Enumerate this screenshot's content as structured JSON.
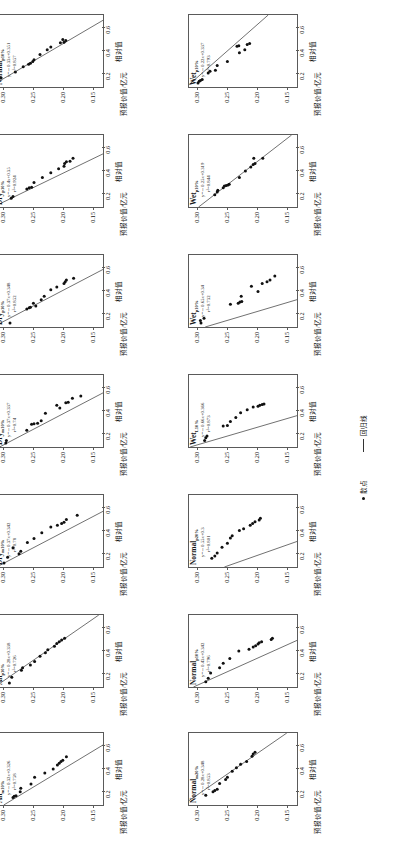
{
  "figure": {
    "axis": {
      "y_label": "预报价值/亿元",
      "x_label": "相对值",
      "y_ticks": [
        "0.30",
        "0.25",
        "0.20",
        "0.15"
      ],
      "x_ticks": [
        "0.2",
        "0.4",
        "0.6"
      ],
      "y_range": [
        0.135,
        0.315
      ],
      "x_range": [
        0.08,
        0.7
      ]
    },
    "legend": {
      "scatter_label": "散点",
      "line_label": "回归线",
      "scatter_marker": "filled-circle-marker",
      "line_marker": "solid-line-marker"
    },
    "colors": {
      "point": "#111111",
      "line": "#333333",
      "frame": "#5a5a5a",
      "text": "#111111"
    }
  },
  "chart_data": [
    {
      "id": "p1",
      "row": 0,
      "col": 0,
      "type": "scatter",
      "title": "Normal",
      "title_sub": "p10%",
      "equation": "y=－0.33x+0.351",
      "r2_text": "r²=0.857",
      "slope": -0.33,
      "intercept": 0.351,
      "r2": 0.857,
      "xlabel": "相对值",
      "ylabel": "预报价值/亿元",
      "xlim": [
        0.08,
        0.7
      ],
      "ylim": [
        0.135,
        0.315
      ],
      "points": [
        {
          "x": 0.12,
          "y": 0.312
        },
        {
          "x": 0.16,
          "y": 0.305
        },
        {
          "x": 0.21,
          "y": 0.281
        },
        {
          "x": 0.255,
          "y": 0.268
        },
        {
          "x": 0.275,
          "y": 0.259
        },
        {
          "x": 0.285,
          "y": 0.256
        },
        {
          "x": 0.3,
          "y": 0.252
        },
        {
          "x": 0.315,
          "y": 0.25
        },
        {
          "x": 0.36,
          "y": 0.24
        },
        {
          "x": 0.4,
          "y": 0.228
        },
        {
          "x": 0.425,
          "y": 0.222
        },
        {
          "x": 0.46,
          "y": 0.206
        },
        {
          "x": 0.465,
          "y": 0.2
        },
        {
          "x": 0.48,
          "y": 0.197
        },
        {
          "x": 0.49,
          "y": 0.202
        }
      ]
    },
    {
      "id": "p2",
      "row": 0,
      "col": 1,
      "type": "scatter",
      "title": "Wet",
      "title_sub": "p10%",
      "equation": "y=－0.22x+0.337",
      "r2_text": "r²=0.793",
      "slope": -0.22,
      "intercept": 0.337,
      "r2": 0.793,
      "xlabel": "相对值",
      "ylabel": "预报价值/亿元",
      "xlim": [
        0.08,
        0.7
      ],
      "ylim": [
        0.135,
        0.315
      ],
      "points": [
        {
          "x": 0.115,
          "y": 0.3
        },
        {
          "x": 0.13,
          "y": 0.298
        },
        {
          "x": 0.135,
          "y": 0.296
        },
        {
          "x": 0.145,
          "y": 0.293
        },
        {
          "x": 0.2,
          "y": 0.283
        },
        {
          "x": 0.215,
          "y": 0.28
        },
        {
          "x": 0.225,
          "y": 0.271
        },
        {
          "x": 0.265,
          "y": 0.268
        },
        {
          "x": 0.3,
          "y": 0.251
        },
        {
          "x": 0.375,
          "y": 0.231
        },
        {
          "x": 0.4,
          "y": 0.222
        },
        {
          "x": 0.43,
          "y": 0.235
        },
        {
          "x": 0.435,
          "y": 0.232
        },
        {
          "x": 0.445,
          "y": 0.218
        },
        {
          "x": 0.455,
          "y": 0.214
        }
      ]
    },
    {
      "id": "p3",
      "row": 1,
      "col": 0,
      "type": "scatter",
      "title": "Dry",
      "title_sub": "p10%",
      "equation": "y=－0.4x+0.35",
      "r2_text": "r²=0.924",
      "slope": -0.4,
      "intercept": 0.35,
      "r2": 0.924,
      "xlabel": "相对值",
      "ylabel": "预报价值/亿元",
      "xlim": [
        0.08,
        0.7
      ],
      "ylim": [
        0.135,
        0.315
      ],
      "points": [
        {
          "x": 0.155,
          "y": 0.288
        },
        {
          "x": 0.17,
          "y": 0.285
        },
        {
          "x": 0.235,
          "y": 0.262
        },
        {
          "x": 0.245,
          "y": 0.258
        },
        {
          "x": 0.25,
          "y": 0.254
        },
        {
          "x": 0.29,
          "y": 0.25
        },
        {
          "x": 0.335,
          "y": 0.236
        },
        {
          "x": 0.375,
          "y": 0.222
        },
        {
          "x": 0.41,
          "y": 0.209
        },
        {
          "x": 0.43,
          "y": 0.2
        },
        {
          "x": 0.455,
          "y": 0.199
        },
        {
          "x": 0.47,
          "y": 0.196
        },
        {
          "x": 0.475,
          "y": 0.19
        },
        {
          "x": 0.5,
          "y": 0.185
        }
      ]
    },
    {
      "id": "p4",
      "row": 1,
      "col": 1,
      "type": "scatter",
      "title": "Wet",
      "title_sub": "p10%",
      "equation": "y=－0.25x+0.319",
      "r2_text": "r²=0.844",
      "slope": -0.25,
      "intercept": 0.319,
      "r2": 0.844,
      "xlabel": "相对值",
      "ylabel": "预报价值/亿元",
      "xlim": [
        0.08,
        0.7
      ],
      "ylim": [
        0.135,
        0.315
      ],
      "points": [
        {
          "x": 0.185,
          "y": 0.272
        },
        {
          "x": 0.21,
          "y": 0.268
        },
        {
          "x": 0.225,
          "y": 0.267
        },
        {
          "x": 0.245,
          "y": 0.258
        },
        {
          "x": 0.26,
          "y": 0.256
        },
        {
          "x": 0.265,
          "y": 0.253
        },
        {
          "x": 0.27,
          "y": 0.25
        },
        {
          "x": 0.275,
          "y": 0.248
        },
        {
          "x": 0.335,
          "y": 0.231
        },
        {
          "x": 0.39,
          "y": 0.221
        },
        {
          "x": 0.425,
          "y": 0.212
        },
        {
          "x": 0.445,
          "y": 0.208
        },
        {
          "x": 0.455,
          "y": 0.205
        },
        {
          "x": 0.5,
          "y": 0.207
        },
        {
          "x": 0.5,
          "y": 0.192
        }
      ]
    },
    {
      "id": "p5",
      "row": 2,
      "col": 0,
      "type": "scatter",
      "title": "Dry",
      "title_sub": "p10%",
      "equation": "y=－0.37x+0.348",
      "r2_text": "r²=0.852",
      "slope": -0.37,
      "intercept": 0.348,
      "r2": 0.852,
      "xlabel": "相对值",
      "ylabel": "预报价值/亿元",
      "xlim": [
        0.08,
        0.7
      ],
      "ylim": [
        0.135,
        0.315
      ],
      "points": [
        {
          "x": 0.115,
          "y": 0.29
        },
        {
          "x": 0.235,
          "y": 0.262
        },
        {
          "x": 0.245,
          "y": 0.258
        },
        {
          "x": 0.25,
          "y": 0.256
        },
        {
          "x": 0.26,
          "y": 0.247
        },
        {
          "x": 0.285,
          "y": 0.251
        },
        {
          "x": 0.315,
          "y": 0.238
        },
        {
          "x": 0.345,
          "y": 0.233
        },
        {
          "x": 0.4,
          "y": 0.222
        },
        {
          "x": 0.425,
          "y": 0.212
        },
        {
          "x": 0.455,
          "y": 0.2
        },
        {
          "x": 0.47,
          "y": 0.198
        },
        {
          "x": 0.485,
          "y": 0.196
        },
        {
          "x": 0.5,
          "y": 0.184
        }
      ]
    },
    {
      "id": "p6",
      "row": 2,
      "col": 1,
      "type": "scatter",
      "title": "Wet",
      "title_sub": "p10%",
      "equation": "y=－0.65x+0.34",
      "r2_text": "r²=0.732",
      "slope": -0.65,
      "intercept": 0.34,
      "r2": 0.732,
      "xlabel": "相对值",
      "ylabel": "预报价值/亿元",
      "xlim": [
        0.08,
        0.7
      ],
      "ylim": [
        0.135,
        0.315
      ],
      "points": [
        {
          "x": 0.115,
          "y": 0.295
        },
        {
          "x": 0.135,
          "y": 0.296
        },
        {
          "x": 0.155,
          "y": 0.29
        },
        {
          "x": 0.275,
          "y": 0.246
        },
        {
          "x": 0.285,
          "y": 0.233
        },
        {
          "x": 0.295,
          "y": 0.23
        },
        {
          "x": 0.3,
          "y": 0.227
        },
        {
          "x": 0.345,
          "y": 0.228
        },
        {
          "x": 0.385,
          "y": 0.2
        },
        {
          "x": 0.43,
          "y": 0.211
        },
        {
          "x": 0.455,
          "y": 0.193
        },
        {
          "x": 0.47,
          "y": 0.185
        },
        {
          "x": 0.485,
          "y": 0.18
        },
        {
          "x": 0.52,
          "y": 0.172
        }
      ]
    },
    {
      "id": "p7",
      "row": 3,
      "col": 0,
      "type": "scatter",
      "title": "Dry",
      "title_sub": "m10%",
      "equation": "y=－0.37x+0.337",
      "r2_text": "r²=0.74",
      "slope": -0.37,
      "intercept": 0.337,
      "r2": 0.74,
      "xlabel": "相对值",
      "ylabel": "预报价值/亿元",
      "xlim": [
        0.08,
        0.7
      ],
      "ylim": [
        0.135,
        0.315
      ],
      "points": [
        {
          "x": 0.115,
          "y": 0.297
        },
        {
          "x": 0.135,
          "y": 0.296
        },
        {
          "x": 0.225,
          "y": 0.262
        },
        {
          "x": 0.275,
          "y": 0.254
        },
        {
          "x": 0.28,
          "y": 0.25
        },
        {
          "x": 0.285,
          "y": 0.244
        },
        {
          "x": 0.305,
          "y": 0.238
        },
        {
          "x": 0.37,
          "y": 0.231
        },
        {
          "x": 0.415,
          "y": 0.207
        },
        {
          "x": 0.44,
          "y": 0.212
        },
        {
          "x": 0.46,
          "y": 0.197
        },
        {
          "x": 0.465,
          "y": 0.193
        },
        {
          "x": 0.5,
          "y": 0.186
        },
        {
          "x": 0.52,
          "y": 0.172
        }
      ]
    },
    {
      "id": "p8",
      "row": 3,
      "col": 1,
      "type": "scatter",
      "title": "Wet",
      "title_sub": "L10%",
      "equation": "y=－0.66x+0.366",
      "r2_text": "r²=0.873",
      "slope": -0.66,
      "intercept": 0.366,
      "r2": 0.873,
      "xlabel": "相对值",
      "ylabel": "预报价值/亿元",
      "xlim": [
        0.08,
        0.7
      ],
      "ylim": [
        0.135,
        0.315
      ],
      "points": [
        {
          "x": 0.135,
          "y": 0.289
        },
        {
          "x": 0.16,
          "y": 0.287
        },
        {
          "x": 0.175,
          "y": 0.285
        },
        {
          "x": 0.26,
          "y": 0.258
        },
        {
          "x": 0.265,
          "y": 0.251
        },
        {
          "x": 0.3,
          "y": 0.246
        },
        {
          "x": 0.335,
          "y": 0.237
        },
        {
          "x": 0.375,
          "y": 0.229
        },
        {
          "x": 0.4,
          "y": 0.218
        },
        {
          "x": 0.425,
          "y": 0.208
        },
        {
          "x": 0.43,
          "y": 0.2
        },
        {
          "x": 0.44,
          "y": 0.197
        },
        {
          "x": 0.445,
          "y": 0.193
        },
        {
          "x": 0.45,
          "y": 0.19
        }
      ]
    },
    {
      "id": "p9",
      "row": 4,
      "col": 0,
      "type": "scatter",
      "title": "Dry",
      "title_sub": "m10%",
      "equation": "y=－0.37x+0.342",
      "r2_text": "r²=0.78",
      "slope": -0.37,
      "intercept": 0.342,
      "r2": 0.78,
      "xlabel": "相对值",
      "ylabel": "预报价值/亿元",
      "xlim": [
        0.08,
        0.7
      ],
      "ylim": [
        0.135,
        0.315
      ],
      "points": [
        {
          "x": 0.115,
          "y": 0.3
        },
        {
          "x": 0.165,
          "y": 0.294
        },
        {
          "x": 0.195,
          "y": 0.275
        },
        {
          "x": 0.215,
          "y": 0.272
        },
        {
          "x": 0.245,
          "y": 0.285
        },
        {
          "x": 0.29,
          "y": 0.261
        },
        {
          "x": 0.325,
          "y": 0.25
        },
        {
          "x": 0.375,
          "y": 0.237
        },
        {
          "x": 0.425,
          "y": 0.222
        },
        {
          "x": 0.44,
          "y": 0.211
        },
        {
          "x": 0.455,
          "y": 0.204
        },
        {
          "x": 0.465,
          "y": 0.2
        },
        {
          "x": 0.49,
          "y": 0.196
        },
        {
          "x": 0.525,
          "y": 0.178
        }
      ]
    },
    {
      "id": "p10",
      "row": 4,
      "col": 1,
      "type": "scatter",
      "title": "Normal",
      "title_sub": "p20%",
      "equation": "y=－0.55x+0.3",
      "r2_text": "r²=0.801",
      "slope": -0.55,
      "intercept": 0.3,
      "r2": 0.801,
      "xlabel": "相对值",
      "ylabel": "预报价值/亿元",
      "xlim": [
        0.08,
        0.7
      ],
      "ylim": [
        0.135,
        0.315
      ],
      "points": [
        {
          "x": 0.155,
          "y": 0.277
        },
        {
          "x": 0.175,
          "y": 0.272
        },
        {
          "x": 0.2,
          "y": 0.268
        },
        {
          "x": 0.25,
          "y": 0.26
        },
        {
          "x": 0.285,
          "y": 0.251
        },
        {
          "x": 0.33,
          "y": 0.246
        },
        {
          "x": 0.35,
          "y": 0.243
        },
        {
          "x": 0.395,
          "y": 0.231
        },
        {
          "x": 0.41,
          "y": 0.224
        },
        {
          "x": 0.44,
          "y": 0.213
        },
        {
          "x": 0.455,
          "y": 0.209
        },
        {
          "x": 0.47,
          "y": 0.205
        },
        {
          "x": 0.485,
          "y": 0.198
        },
        {
          "x": 0.5,
          "y": 0.196
        }
      ]
    },
    {
      "id": "p11",
      "row": 5,
      "col": 0,
      "type": "scatter",
      "title": "All",
      "title_sub": "p10%",
      "equation": "y=－0.28x+0.338",
      "r2_text": "r²=0.726",
      "slope": -0.28,
      "intercept": 0.338,
      "r2": 0.726,
      "xlabel": "相对值",
      "ylabel": "预报价值/亿元",
      "xlim": [
        0.08,
        0.7
      ],
      "ylim": [
        0.135,
        0.315
      ],
      "points": [
        {
          "x": 0.115,
          "y": 0.291
        },
        {
          "x": 0.165,
          "y": 0.287
        },
        {
          "x": 0.225,
          "y": 0.271
        },
        {
          "x": 0.245,
          "y": 0.269
        },
        {
          "x": 0.27,
          "y": 0.256
        },
        {
          "x": 0.3,
          "y": 0.249
        },
        {
          "x": 0.345,
          "y": 0.24
        },
        {
          "x": 0.375,
          "y": 0.231
        },
        {
          "x": 0.4,
          "y": 0.227
        },
        {
          "x": 0.43,
          "y": 0.216
        },
        {
          "x": 0.455,
          "y": 0.212
        },
        {
          "x": 0.47,
          "y": 0.208
        },
        {
          "x": 0.485,
          "y": 0.204
        },
        {
          "x": 0.5,
          "y": 0.199
        }
      ]
    },
    {
      "id": "p12",
      "row": 5,
      "col": 1,
      "type": "scatter",
      "title": "Normal",
      "title_sub": "p10%",
      "equation": "y=－0.43x+0.342",
      "r2_text": "r²=0.796",
      "slope": -0.43,
      "intercept": 0.342,
      "r2": 0.796,
      "xlabel": "相对值",
      "ylabel": "预报价值/亿元",
      "xlim": [
        0.08,
        0.7
      ],
      "ylim": [
        0.135,
        0.315
      ],
      "points": [
        {
          "x": 0.125,
          "y": 0.287
        },
        {
          "x": 0.155,
          "y": 0.283
        },
        {
          "x": 0.2,
          "y": 0.279
        },
        {
          "x": 0.245,
          "y": 0.264
        },
        {
          "x": 0.285,
          "y": 0.258
        },
        {
          "x": 0.325,
          "y": 0.247
        },
        {
          "x": 0.39,
          "y": 0.232
        },
        {
          "x": 0.405,
          "y": 0.215
        },
        {
          "x": 0.425,
          "y": 0.208
        },
        {
          "x": 0.435,
          "y": 0.204
        },
        {
          "x": 0.45,
          "y": 0.2
        },
        {
          "x": 0.46,
          "y": 0.198
        },
        {
          "x": 0.47,
          "y": 0.194
        },
        {
          "x": 0.49,
          "y": 0.178
        },
        {
          "x": 0.5,
          "y": 0.176
        }
      ]
    },
    {
      "id": "p13",
      "row": 6,
      "col": 0,
      "type": "scatter",
      "title": "All",
      "title_sub": "m10%",
      "equation": "y=－0.32x+0.326",
      "r2_text": "r²=0.758",
      "slope": -0.32,
      "intercept": 0.326,
      "r2": 0.758,
      "xlabel": "相对值",
      "ylabel": "预报价值/亿元",
      "xlim": [
        0.08,
        0.7
      ],
      "ylim": [
        0.135,
        0.315
      ],
      "points": [
        {
          "x": 0.145,
          "y": 0.285
        },
        {
          "x": 0.155,
          "y": 0.283
        },
        {
          "x": 0.16,
          "y": 0.28
        },
        {
          "x": 0.195,
          "y": 0.273
        },
        {
          "x": 0.225,
          "y": 0.272
        },
        {
          "x": 0.26,
          "y": 0.255
        },
        {
          "x": 0.32,
          "y": 0.249
        },
        {
          "x": 0.355,
          "y": 0.232
        },
        {
          "x": 0.39,
          "y": 0.218
        },
        {
          "x": 0.425,
          "y": 0.211
        },
        {
          "x": 0.44,
          "y": 0.208
        },
        {
          "x": 0.455,
          "y": 0.205
        },
        {
          "x": 0.465,
          "y": 0.202
        },
        {
          "x": 0.495,
          "y": 0.196
        }
      ]
    },
    {
      "id": "p14",
      "row": 6,
      "col": 1,
      "type": "scatter",
      "title": "Normal",
      "title_sub": "m20%",
      "equation": "y=－0.28x+0.348",
      "r2_text": "r²=0.853",
      "slope": -0.28,
      "intercept": 0.348,
      "r2": 0.853,
      "xlabel": "相对值",
      "ylabel": "预报价值/亿元",
      "xlim": [
        0.08,
        0.7
      ],
      "ylim": [
        0.135,
        0.315
      ],
      "points": [
        {
          "x": 0.165,
          "y": 0.287
        },
        {
          "x": 0.195,
          "y": 0.275
        },
        {
          "x": 0.205,
          "y": 0.272
        },
        {
          "x": 0.215,
          "y": 0.268
        },
        {
          "x": 0.265,
          "y": 0.264
        },
        {
          "x": 0.3,
          "y": 0.254
        },
        {
          "x": 0.32,
          "y": 0.251
        },
        {
          "x": 0.37,
          "y": 0.243
        },
        {
          "x": 0.4,
          "y": 0.236
        },
        {
          "x": 0.43,
          "y": 0.229
        },
        {
          "x": 0.455,
          "y": 0.219
        },
        {
          "x": 0.5,
          "y": 0.21
        },
        {
          "x": 0.52,
          "y": 0.208
        },
        {
          "x": 0.535,
          "y": 0.205
        }
      ]
    }
  ]
}
